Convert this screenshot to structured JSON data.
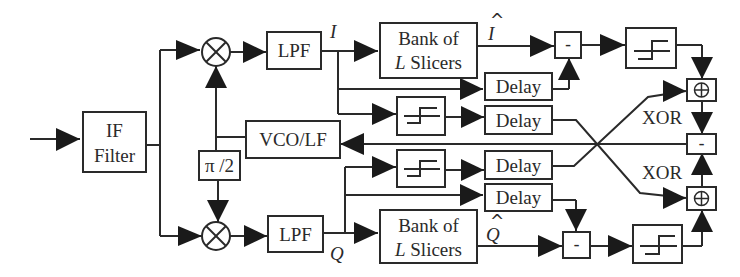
{
  "diagram": {
    "type": "block-diagram",
    "blocks": {
      "if_filter": {
        "line1": "IF",
        "line2": "Filter"
      },
      "lpf_i": "LPF",
      "lpf_q": "LPF",
      "vco_lf": "VCO/LF",
      "phase_shift": "π /2",
      "bank_i": {
        "line1": "Bank of",
        "line2_italic": "L",
        "line2": " Slicers"
      },
      "bank_q": {
        "line1": "Bank of",
        "line2_italic": "L",
        "line2": " Slicers"
      },
      "delay_1": "Delay",
      "delay_2": "Delay",
      "delay_3": "Delay",
      "delay_4": "Delay",
      "subtract_i": "-",
      "subtract_q": "-",
      "subtract_out": "-",
      "xor_top": "⊕",
      "xor_bottom": "⊕"
    },
    "signal_labels": {
      "i": "I",
      "q": "Q",
      "i_hat": "I",
      "q_hat": "Q",
      "hat": "^"
    },
    "annotations": {
      "xor_top": "XOR",
      "xor_bottom": "XOR"
    },
    "colors": {
      "line": "#2a2a2a",
      "arrow": "#1a1a1a",
      "background": "#ffffff"
    }
  }
}
